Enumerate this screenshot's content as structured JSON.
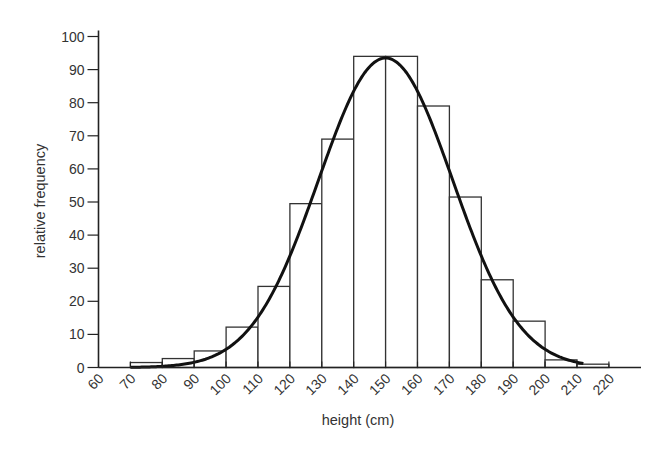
{
  "chart_data": {
    "type": "bar",
    "title": "",
    "xlabel": "height (cm)",
    "ylabel": "relative frequency",
    "xlim": [
      60,
      220
    ],
    "ylim": [
      0,
      100
    ],
    "grid": false,
    "x_ticks": [
      60,
      70,
      80,
      90,
      100,
      110,
      120,
      130,
      140,
      150,
      160,
      170,
      180,
      190,
      200,
      210,
      220
    ],
    "y_ticks": [
      0,
      10,
      20,
      30,
      40,
      50,
      60,
      70,
      80,
      90,
      100
    ],
    "bins": [
      {
        "from": 70,
        "to": 80,
        "value": 1.5
      },
      {
        "from": 80,
        "to": 90,
        "value": 2.7
      },
      {
        "from": 90,
        "to": 100,
        "value": 5
      },
      {
        "from": 100,
        "to": 110,
        "value": 12.2
      },
      {
        "from": 110,
        "to": 120,
        "value": 24.5
      },
      {
        "from": 120,
        "to": 130,
        "value": 49.5
      },
      {
        "from": 130,
        "to": 140,
        "value": 69
      },
      {
        "from": 140,
        "to": 150,
        "value": 94
      },
      {
        "from": 150,
        "to": 160,
        "value": 94
      },
      {
        "from": 160,
        "to": 170,
        "value": 79
      },
      {
        "from": 170,
        "to": 180,
        "value": 51.5
      },
      {
        "from": 180,
        "to": 190,
        "value": 26.5
      },
      {
        "from": 190,
        "to": 200,
        "value": 14
      },
      {
        "from": 200,
        "to": 210,
        "value": 2.3
      },
      {
        "from": 210,
        "to": 220,
        "value": 1
      }
    ],
    "curve": {
      "type": "normal",
      "mean": 150,
      "sd": 21,
      "peak": 93.5,
      "x_range": [
        70,
        212
      ]
    },
    "colors": {
      "bar_fill": "#ffffff",
      "bar_stroke": "#333333",
      "curve": "#111111",
      "axis": "#222222",
      "text": "#333333"
    }
  }
}
